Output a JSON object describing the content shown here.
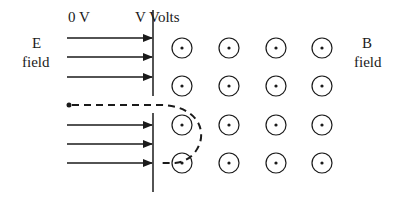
{
  "labels": {
    "zero_volts": "0 V",
    "v_volts": "V Volts",
    "e_field_line1": "E",
    "e_field_line2": "field",
    "b_field_line1": "B",
    "b_field_line2": "field"
  },
  "e_field": {
    "arrow_rows_y": [
      38,
      57,
      77,
      125,
      144,
      163
    ],
    "arrow_start_x": 67,
    "arrow_end_x": 152,
    "direction": "right"
  },
  "plate": {
    "x": 153,
    "top_y": 10,
    "gap_start_y": 96,
    "gap_end_y": 113,
    "bottom_y": 192
  },
  "b_field": {
    "symbol": "out-of-page (dot in circle)",
    "columns_x": [
      182,
      229,
      276,
      322
    ],
    "rows_y": [
      48,
      86,
      125,
      163
    ],
    "radius": 10
  },
  "trajectory": {
    "style": "dashed",
    "start_dot": [
      69,
      105
    ],
    "description": "particle path enters at bottom, curves in B field, exits back through plate to left"
  },
  "colors": {
    "ink": "#1a1a1a",
    "background": "#ffffff"
  }
}
